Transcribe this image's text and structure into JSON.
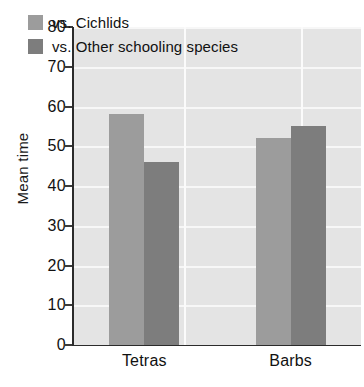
{
  "chart_data": {
    "type": "bar",
    "title": "",
    "subtitle": "",
    "xlabel": "",
    "ylabel": "Mean time",
    "categories": [
      "Tetras",
      "Barbs"
    ],
    "series": [
      {
        "name": "vs. Cichlids",
        "values": [
          58,
          52
        ],
        "color": "#9c9c9c"
      },
      {
        "name": "vs. Other schooling species",
        "values": [
          46,
          55
        ],
        "color": "#7d7d7d"
      }
    ],
    "ylim": [
      0,
      80
    ],
    "yticks": [
      0,
      10,
      20,
      30,
      40,
      50,
      60,
      70,
      80
    ],
    "ytick_labels": [
      "0",
      "10",
      "20",
      "30",
      "40",
      "50",
      "60",
      "70",
      "80"
    ],
    "grid": "horizontal-and-vertical",
    "grid_color": "#f7f7f7",
    "plot_background": "#e4e4e4",
    "legend_position": "top-left-inside",
    "legend_entries": [
      "vs. Cichlids",
      "vs. Other schooling species"
    ],
    "annotations": []
  }
}
